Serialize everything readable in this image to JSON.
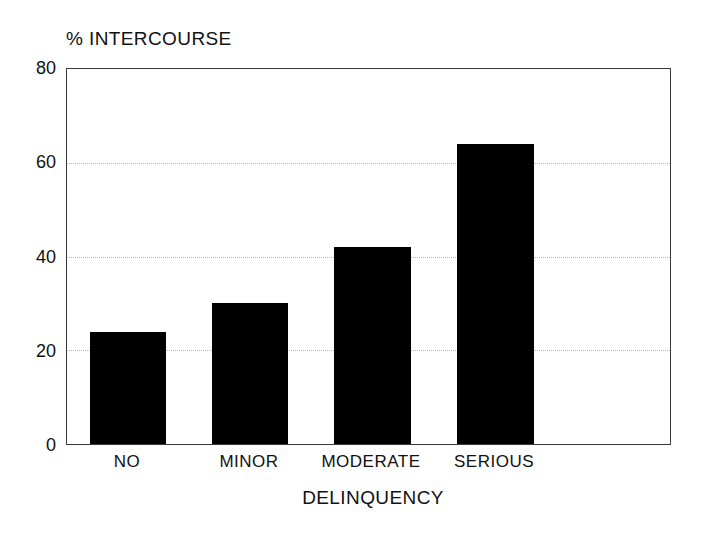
{
  "chart_data": {
    "type": "bar",
    "title": "% INTERCOURSE",
    "xlabel": "DELINQUENCY",
    "ylabel": "% INTERCOURSE",
    "categories": [
      "NO",
      "MINOR",
      "MODERATE",
      "SERIOUS"
    ],
    "values": [
      24,
      30,
      42,
      64
    ],
    "ylim": [
      0,
      80
    ],
    "yticks": [
      0,
      20,
      40,
      60,
      80
    ],
    "gridlines_at": [
      20,
      40,
      60
    ],
    "grid": true,
    "legend": "none",
    "bar_color": "#000000",
    "grid_color": "#b9b9b9",
    "axis_color": "#3a3a3a",
    "background": "#ffffff"
  },
  "axis": {
    "y_tick_labels": [
      "80",
      "60",
      "40",
      "20",
      "0"
    ],
    "x_tick_labels": [
      "NO",
      "MINOR",
      "MODERATE",
      "SERIOUS"
    ]
  }
}
